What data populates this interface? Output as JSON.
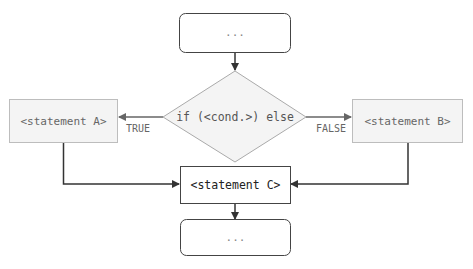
{
  "diagram": {
    "start_box": {
      "label": "..."
    },
    "decision": {
      "label": "if (<cond.>) else"
    },
    "statement_a": {
      "label": "<statement A>"
    },
    "statement_b": {
      "label": "<statement B>"
    },
    "statement_c": {
      "label": "<statement C>"
    },
    "end_box": {
      "label": "..."
    },
    "edges": {
      "true_label": "TRUE",
      "false_label": "FALSE"
    },
    "colors": {
      "line": "#333333",
      "box_fill_gray": "#f4f4f4",
      "box_stroke_gray": "#bdbdbd",
      "text_gray": "#666666",
      "text_dark": "#222222"
    }
  }
}
